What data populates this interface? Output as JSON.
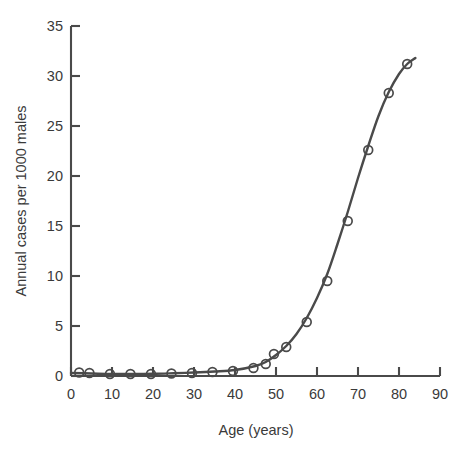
{
  "chart_data": {
    "type": "scatter",
    "title": "",
    "subtitle": "",
    "xlabel": "Age (years)",
    "ylabel": "Annual cases per 1000 males",
    "xlim": [
      0,
      90
    ],
    "ylim": [
      0,
      35
    ],
    "xticks": [
      0,
      10,
      20,
      30,
      40,
      50,
      60,
      70,
      80,
      90
    ],
    "xtick_labels": [
      "0",
      "10",
      "20",
      "30",
      "40",
      "50",
      "60",
      "70",
      "80",
      "90"
    ],
    "yticks": [
      0,
      5,
      10,
      15,
      20,
      25,
      30,
      35
    ],
    "ytick_labels": [
      "0",
      "5",
      "10",
      "15",
      "20",
      "25",
      "30",
      "35"
    ],
    "grid": false,
    "legend": null,
    "series": [
      {
        "name": "observed",
        "marker": "open-circle",
        "color": "#4a4a4a",
        "x": [
          2,
          4.5,
          9.5,
          14.5,
          19.5,
          24.5,
          29.5,
          34.5,
          39.5,
          44.5,
          47.5,
          49.5,
          52.5,
          57.5,
          62.5,
          67.5,
          72.5,
          77.5,
          82
        ],
        "y": [
          0.35,
          0.3,
          0.2,
          0.2,
          0.2,
          0.25,
          0.3,
          0.4,
          0.5,
          0.8,
          1.2,
          2.2,
          2.9,
          5.4,
          9.5,
          15.5,
          22.6,
          28.3,
          31.2
        ]
      },
      {
        "name": "fitted-curve",
        "marker": "none",
        "line": "solid",
        "color": "#4a4a4a",
        "x": [
          0,
          5,
          10,
          15,
          20,
          25,
          30,
          35,
          40,
          45,
          47.5,
          50,
          52.5,
          55,
          57.5,
          60,
          62.5,
          65,
          67.5,
          70,
          72.5,
          75,
          77.5,
          80,
          82,
          84
        ],
        "y": [
          0.3,
          0.25,
          0.2,
          0.2,
          0.22,
          0.28,
          0.35,
          0.45,
          0.6,
          1.0,
          1.4,
          2.1,
          3.0,
          4.2,
          5.8,
          7.8,
          10.2,
          13.2,
          16.4,
          19.8,
          23.0,
          26.0,
          28.4,
          30.2,
          31.2,
          31.8
        ]
      }
    ],
    "last_point_label": "31.0"
  },
  "axes": {
    "x_axis_name": "x-axis",
    "y_axis_name": "y-axis"
  }
}
